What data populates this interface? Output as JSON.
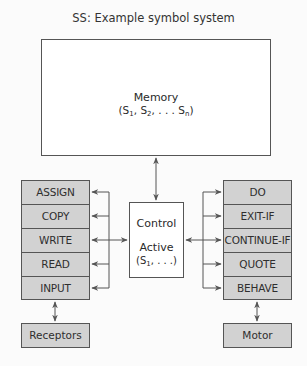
{
  "title": "SS: Example symbol system",
  "memory": {
    "label": "Memory",
    "contents_prefix": "(S",
    "sub1": "1",
    "sep1": ", S",
    "sub2": "2",
    "sep2": ", . . . S",
    "subn": "n",
    "suffix": ")"
  },
  "control": {
    "label": "Control",
    "active_label": "Active",
    "active_prefix": "(S",
    "active_sub": "1",
    "active_suffix": ", . . .)"
  },
  "left_operators": [
    "ASSIGN",
    "COPY",
    "WRITE",
    "READ",
    "INPUT"
  ],
  "right_operators": [
    "DO",
    "EXIT-IF",
    "CONTINUE-IF",
    "QUOTE",
    "BEHAVE"
  ],
  "receptors": "Receptors",
  "motor": "Motor",
  "colors": {
    "box_fill": "#d2d2d2",
    "border": "#555555",
    "background": "#fbfbfb"
  }
}
